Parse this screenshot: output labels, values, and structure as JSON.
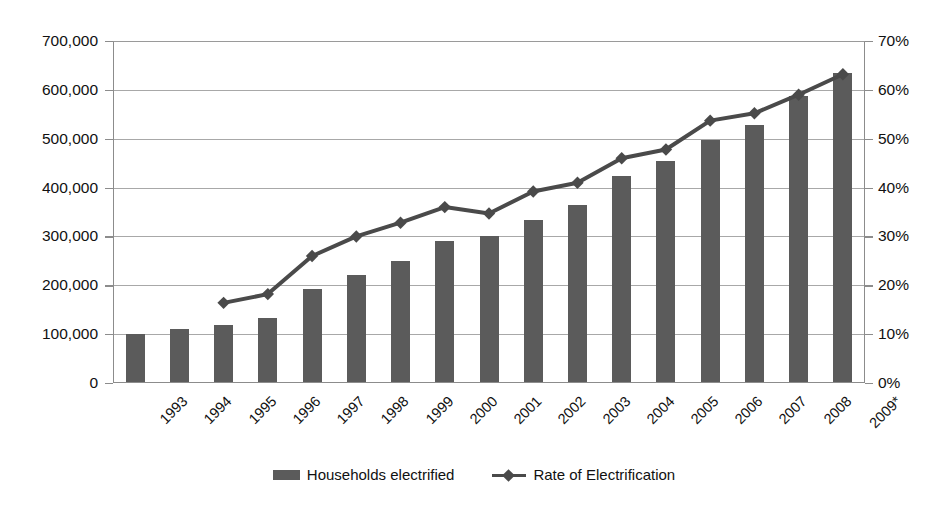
{
  "chart_data": {
    "type": "bar",
    "title": "",
    "subtitle": "",
    "xlabel": "",
    "ylabel": "",
    "grid": true,
    "legend_position": "bottom",
    "categories": [
      "1993",
      "1994",
      "1995",
      "1996",
      "1997",
      "1998",
      "1999",
      "2000",
      "2001",
      "2002",
      "2003",
      "2004",
      "2005",
      "2006",
      "2007",
      "2008",
      "2009*"
    ],
    "axes": {
      "left": {
        "label": "",
        "ylim": [
          0,
          700000
        ],
        "tick_step": 100000,
        "ticks": [
          0,
          100000,
          200000,
          300000,
          400000,
          500000,
          600000,
          700000
        ],
        "tick_labels": [
          "0",
          "100,000",
          "200,000",
          "300,000",
          "400,000",
          "500,000",
          "600,000",
          "700,000"
        ]
      },
      "right": {
        "label": "",
        "ylim": [
          0,
          70
        ],
        "tick_step": 10,
        "ticks": [
          0,
          10,
          20,
          30,
          40,
          50,
          60,
          70
        ],
        "tick_labels": [
          "0%",
          "10%",
          "20%",
          "30%",
          "40%",
          "50%",
          "60%",
          "70%"
        ]
      }
    },
    "series": [
      {
        "name": "Households electrified",
        "type": "bar",
        "axis": "left",
        "color": "#5b5b5b",
        "values": [
          101000,
          110000,
          118000,
          133000,
          193000,
          222000,
          250000,
          290000,
          300000,
          334000,
          364000,
          424000,
          455000,
          498000,
          528000,
          588000,
          634000
        ]
      },
      {
        "name": "Rate of Electrification",
        "type": "line",
        "axis": "right",
        "color": "#4a4a4a",
        "marker": "diamond",
        "values": [
          null,
          null,
          16.4,
          18.2,
          26.0,
          30.0,
          32.8,
          36.0,
          34.7,
          39.2,
          41.0,
          46.0,
          47.8,
          53.7,
          55.2,
          59.0,
          63.2
        ]
      }
    ]
  },
  "legend": {
    "items": [
      {
        "label": "Households electrified",
        "marker": "bar-swatch",
        "color": "#5b5b5b"
      },
      {
        "label": "Rate of Electrification",
        "marker": "line-diamond",
        "color": "#4a4a4a"
      }
    ]
  },
  "colors": {
    "bar": "#5b5b5b",
    "line": "#4a4a4a",
    "grid": "#a8a8a8",
    "axis": "#8c8c8c",
    "text": "#111111",
    "background": "#ffffff"
  }
}
